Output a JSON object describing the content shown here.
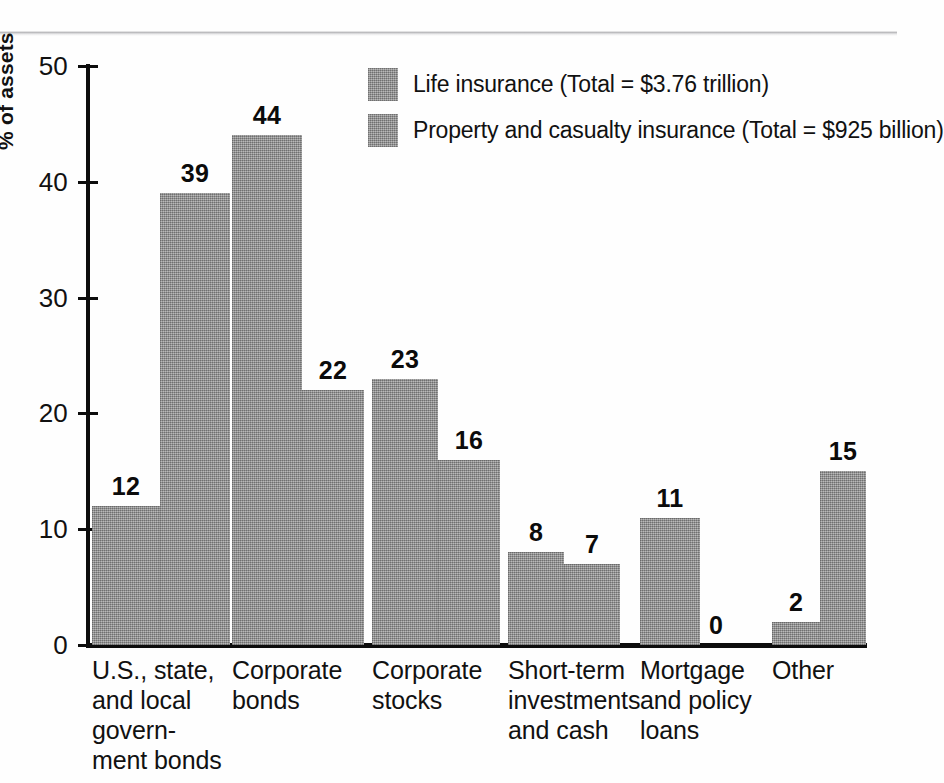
{
  "chart_data": {
    "type": "bar",
    "title": "",
    "xlabel": "",
    "ylabel": "% of assets",
    "ylim": [
      0,
      50
    ],
    "yticks": [
      "0",
      "10",
      "20",
      "30",
      "40",
      "50"
    ],
    "grid": false,
    "legend_position": "top-center",
    "categories": [
      "U.S., state,\nand local\ngovern-\nment bonds",
      "Corporate\nbonds",
      "Corporate\nstocks",
      "Short-term\ninvestments\nand cash",
      "Mortgage\nand policy\nloans",
      "Other"
    ],
    "series": [
      {
        "name": "Life insurance (Total = $3.76 trillion)",
        "short_name": "Life insurance",
        "total": "$3.76 trillion",
        "color": "#9d9d9d",
        "values": [
          12,
          44,
          23,
          8,
          11,
          2
        ]
      },
      {
        "name": "Property and casualty insurance (Total = $925 billion)",
        "short_name": "Property and casualty insurance",
        "total": "$925 billion",
        "color": "#9d9d9d",
        "values": [
          39,
          22,
          16,
          7,
          0,
          15
        ]
      }
    ]
  },
  "axis": {
    "y_label": "% of assets",
    "y_ticks": [
      "50",
      "40",
      "30",
      "20",
      "10",
      "0"
    ]
  },
  "legend": {
    "items": [
      {
        "label": "Life insurance (Total = $3.76 trillion)"
      },
      {
        "label": "Property and casualty insurance (Total = $925 billion)"
      }
    ]
  },
  "categories": [
    {
      "label": "U.S., state,\nand local\ngovern-\nment bonds"
    },
    {
      "label": "Corporate\nbonds"
    },
    {
      "label": "Corporate\nstocks"
    },
    {
      "label": "Short-term\ninvestments\nand cash"
    },
    {
      "label": "Mortgage\nand policy\nloans"
    },
    {
      "label": "Other"
    }
  ],
  "values": {
    "g0s0": "12",
    "g0s1": "39",
    "g1s0": "44",
    "g1s1": "22",
    "g2s0": "23",
    "g2s1": "16",
    "g3s0": "8",
    "g3s1": "7",
    "g4s0": "11",
    "g4s1": "0",
    "g5s0": "2",
    "g5s1": "15"
  }
}
